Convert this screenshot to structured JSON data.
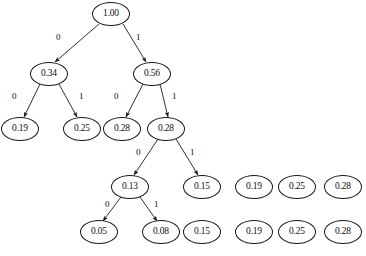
{
  "figure": {
    "type": "binary-tree-diagram",
    "node_shape": "ellipse",
    "node_border_color": "#1a1a1a",
    "node_fill_color": "#ffffff",
    "edge_color": "#1a1a1a",
    "background_color": "#ffffff",
    "width": 366,
    "height": 256
  },
  "nodes": [
    {
      "id": "n0",
      "label": "1.00",
      "cx": 111,
      "cy": 14,
      "rx": 19,
      "ry": 12,
      "level": 0
    },
    {
      "id": "n1",
      "label": "0.34",
      "cx": 49,
      "cy": 74,
      "rx": 19,
      "ry": 12,
      "level": 1
    },
    {
      "id": "n2",
      "label": "0.56",
      "cx": 152,
      "cy": 74,
      "rx": 19,
      "ry": 12,
      "level": 1
    },
    {
      "id": "n3",
      "label": "0.19",
      "cx": 20,
      "cy": 129,
      "rx": 19,
      "ry": 12,
      "level": 2
    },
    {
      "id": "n4",
      "label": "0.25",
      "cx": 82,
      "cy": 129,
      "rx": 19,
      "ry": 12,
      "level": 2
    },
    {
      "id": "n5",
      "label": "0.28",
      "cx": 122,
      "cy": 129,
      "rx": 19,
      "ry": 12,
      "level": 2
    },
    {
      "id": "n6",
      "label": "0.28",
      "cx": 166,
      "cy": 129,
      "rx": 19,
      "ry": 12,
      "level": 2
    },
    {
      "id": "n7",
      "label": "0.13",
      "cx": 130,
      "cy": 187,
      "rx": 19,
      "ry": 12,
      "level": 3
    },
    {
      "id": "n8",
      "label": "0.15",
      "cx": 202,
      "cy": 187,
      "rx": 19,
      "ry": 12,
      "level": 3
    },
    {
      "id": "n9",
      "label": "0.19",
      "cx": 254,
      "cy": 187,
      "rx": 19,
      "ry": 12,
      "level": 3
    },
    {
      "id": "n10",
      "label": "0.25",
      "cx": 297,
      "cy": 187,
      "rx": 19,
      "ry": 12,
      "level": 3
    },
    {
      "id": "n11",
      "label": "0.28",
      "cx": 343,
      "cy": 187,
      "rx": 19,
      "ry": 12,
      "level": 3
    },
    {
      "id": "n12",
      "label": "0.05",
      "cx": 99,
      "cy": 232,
      "rx": 19,
      "ry": 12,
      "level": 4
    },
    {
      "id": "n13",
      "label": "0.08",
      "cx": 161,
      "cy": 232,
      "rx": 19,
      "ry": 12,
      "level": 4
    },
    {
      "id": "n14",
      "label": "0.15",
      "cx": 202,
      "cy": 232,
      "rx": 19,
      "ry": 12,
      "level": 4
    },
    {
      "id": "n15",
      "label": "0.19",
      "cx": 254,
      "cy": 232,
      "rx": 19,
      "ry": 12,
      "level": 4
    },
    {
      "id": "n16",
      "label": "0.25",
      "cx": 297,
      "cy": 232,
      "rx": 19,
      "ry": 12,
      "level": 4
    },
    {
      "id": "n17",
      "label": "0.28",
      "cx": 343,
      "cy": 232,
      "rx": 19,
      "ry": 12,
      "level": 4
    }
  ],
  "edges": [
    {
      "id": "e0",
      "from": "n0",
      "to": "n1",
      "label": "0",
      "x1": 99,
      "y1": 24,
      "x2": 55,
      "y2": 62,
      "lx": 56,
      "ly": 33
    },
    {
      "id": "e1",
      "from": "n0",
      "to": "n2",
      "label": "1",
      "x1": 123,
      "y1": 24,
      "x2": 146,
      "y2": 62,
      "lx": 136,
      "ly": 33
    },
    {
      "id": "e2",
      "from": "n1",
      "to": "n3",
      "label": "0",
      "x1": 40,
      "y1": 84,
      "x2": 24,
      "y2": 117,
      "lx": 12,
      "ly": 92
    },
    {
      "id": "e3",
      "from": "n1",
      "to": "n4",
      "label": "1",
      "x1": 59,
      "y1": 84,
      "x2": 77,
      "y2": 117,
      "lx": 79,
      "ly": 92
    },
    {
      "id": "e4",
      "from": "n2",
      "to": "n5",
      "label": "0",
      "x1": 143,
      "y1": 84,
      "x2": 126,
      "y2": 117,
      "lx": 114,
      "ly": 92
    },
    {
      "id": "e5",
      "from": "n2",
      "to": "n6",
      "label": "1",
      "x1": 160,
      "y1": 84,
      "x2": 168,
      "y2": 117,
      "lx": 172,
      "ly": 92
    },
    {
      "id": "e6",
      "from": "n6",
      "to": "n7",
      "label": "0",
      "x1": 158,
      "y1": 139,
      "x2": 134,
      "y2": 175,
      "lx": 136,
      "ly": 148
    },
    {
      "id": "e7",
      "from": "n6",
      "to": "n8",
      "label": "1",
      "x1": 176,
      "y1": 139,
      "x2": 198,
      "y2": 175,
      "lx": 190,
      "ly": 148
    },
    {
      "id": "e8",
      "from": "n7",
      "to": "n12",
      "label": "0",
      "x1": 121,
      "y1": 197,
      "x2": 103,
      "y2": 221,
      "lx": 105,
      "ly": 200
    },
    {
      "id": "e9",
      "from": "n7",
      "to": "n13",
      "label": "1",
      "x1": 140,
      "y1": 197,
      "x2": 157,
      "y2": 221,
      "lx": 154,
      "ly": 200
    }
  ]
}
